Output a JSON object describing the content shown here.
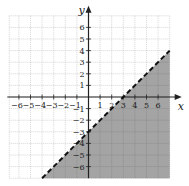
{
  "chart_data": {
    "type": "area",
    "title": "",
    "xlabel": "x",
    "ylabel": "y",
    "xlim": [
      -7,
      7
    ],
    "ylim": [
      -7,
      7
    ],
    "grid": true,
    "x_ticks": [
      -6,
      -5,
      -4,
      -3,
      -2,
      -1,
      1,
      2,
      3,
      4,
      5,
      6
    ],
    "y_ticks": [
      -6,
      -5,
      -4,
      -3,
      -2,
      -1,
      1,
      2,
      3,
      4,
      5,
      6
    ],
    "boundary_line": {
      "equation": "y = x - 3",
      "slope": 1,
      "intercept": -3,
      "style": "dashed",
      "points": [
        [
          -4,
          -7
        ],
        [
          7,
          4
        ]
      ]
    },
    "shaded_region": "below line (y < x - 3)",
    "shade_color": "#9a9a9a",
    "line_color": "#111111"
  },
  "labels": {
    "x_axis": "x",
    "y_axis": "y"
  }
}
